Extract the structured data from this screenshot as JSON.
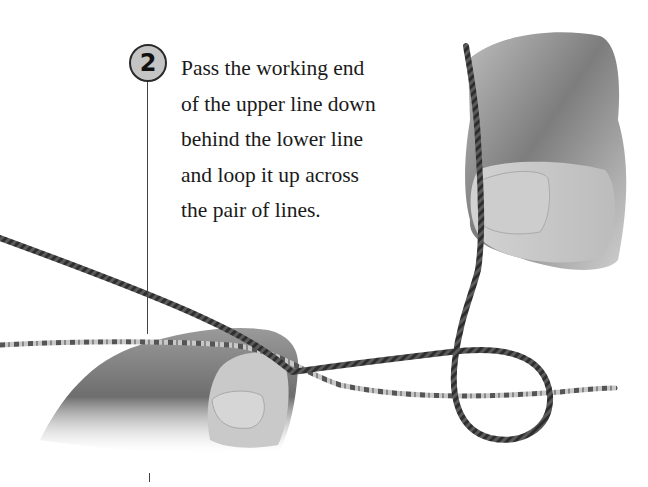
{
  "step": {
    "number": "2",
    "instruction_lines": [
      "Pass the working end",
      "of the upper line down",
      "behind the lower line",
      "and loop it up across",
      "the pair of lines."
    ]
  },
  "illustration": {
    "description": "Photograph of two hands tying a knot: left hand holds upper dark line and lower speckled line together; right hand holds the working end above, which loops down behind the lower line and back up across both lines.",
    "colors": {
      "background": "#ffffff",
      "skin_light": "#d9d9d9",
      "skin_dark": "#8a8a8a",
      "dark_line": "#3a3a3a",
      "light_line": "#bdbdbd",
      "badge_fill": "#c4c4c4"
    }
  }
}
